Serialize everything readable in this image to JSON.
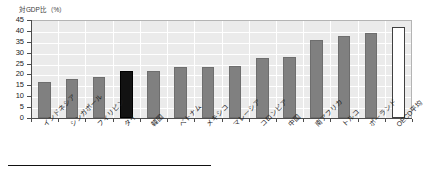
{
  "chart_data": {
    "type": "bar",
    "title": "対GDP比（%）",
    "xlabel": "",
    "ylabel": "対GDP比（%）",
    "ylim": [
      0,
      45
    ],
    "ytick_step": 5,
    "yticks": [
      "45",
      "40",
      "35",
      "30",
      "25",
      "20",
      "15",
      "10",
      "5",
      "0"
    ],
    "grid": true,
    "legend": "none",
    "categories": [
      "インドネシア",
      "シンガポール",
      "フィリピン",
      "タイ",
      "韓国",
      "ベトナム",
      "メキシコ",
      "マレーシア",
      "コロンビア",
      "中国",
      "南アフリカ",
      "トルコ",
      "ポーランド",
      "OECD平均"
    ],
    "values": [
      16.7,
      18.0,
      18.8,
      21.5,
      21.6,
      23.6,
      23.6,
      23.8,
      27.5,
      28.2,
      35.9,
      37.6,
      39.0,
      41.7
    ],
    "bar_styles": [
      "normal",
      "normal",
      "normal",
      "highlight",
      "normal",
      "normal",
      "normal",
      "normal",
      "normal",
      "normal",
      "normal",
      "normal",
      "normal",
      "outline"
    ]
  },
  "colors": {
    "bar_default": "#808080",
    "bar_highlight": "#121212",
    "bar_outline_fill": "#ffffff",
    "bar_outline_stroke": "#404040",
    "plot_background": "#ebebeb",
    "gridline": "#ffffff",
    "axis": "#4d4d4d",
    "text": "#1a1a1a"
  }
}
